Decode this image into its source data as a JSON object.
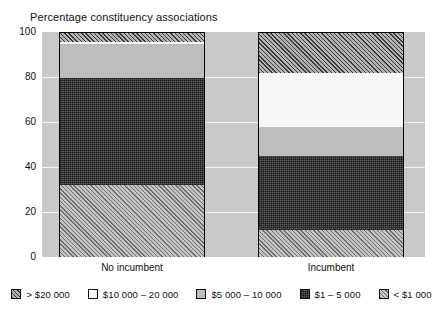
{
  "chart_data": {
    "type": "bar",
    "title": "Percentage constituency associations",
    "subtitle": "",
    "xlabel": "",
    "ylabel": "",
    "stacked": true,
    "stack_total": 100,
    "grid": true,
    "legend_position": "bottom",
    "ylim": [
      0,
      100
    ],
    "yticks": [
      "0",
      "20",
      "40",
      "60",
      "80",
      "100"
    ],
    "ytick_values": [
      0,
      20,
      40,
      60,
      80,
      100
    ],
    "categories": [
      "No incumbent",
      "Incumbent"
    ],
    "series": [
      {
        "name": "> $20 000",
        "key": "gt20",
        "values": [
          4,
          18
        ]
      },
      {
        "name": "$10 000 – 20 000",
        "key": "b1020",
        "values": [
          1,
          24
        ]
      },
      {
        "name": "$5 000 – 10 000",
        "key": "b0510",
        "values": [
          15,
          13
        ]
      },
      {
        "name": "$1 – 5 000",
        "key": "b0105",
        "values": [
          48,
          33
        ]
      },
      {
        "name": "< $1 000",
        "key": "lt1",
        "values": [
          32,
          12
        ]
      }
    ]
  },
  "axis": {
    "y_ticks": [
      {
        "label": "100",
        "value": 100
      },
      {
        "label": "80",
        "value": 80
      },
      {
        "label": "60",
        "value": 60
      },
      {
        "label": "40",
        "value": 40
      },
      {
        "label": "20",
        "value": 20
      },
      {
        "label": "0",
        "value": 0
      }
    ],
    "category_labels": [
      "No incumbent",
      "Incumbent"
    ]
  },
  "legend": {
    "items": [
      {
        "label": "> $20 000",
        "pattern": "diagonal-hatch-dark"
      },
      {
        "label": "$10 000 – 20 000",
        "pattern": "empty-white"
      },
      {
        "label": "$5 000 – 10 000",
        "pattern": "solid-light-gray"
      },
      {
        "label": "$1 – 5 000",
        "pattern": "dense-stipple-dark"
      },
      {
        "label": "< $1 000",
        "pattern": "diagonal-hatch-light"
      }
    ]
  },
  "colors": {
    "plot_background": "#c9c9c9",
    "gt20": "#b4b4b4",
    "b1020": "#f7f7f5",
    "b0510": "#bdbdbd",
    "b0105": "#5c5c5c",
    "lt1": "#c4c4c4",
    "outline": "#000000",
    "text": "#111111"
  }
}
